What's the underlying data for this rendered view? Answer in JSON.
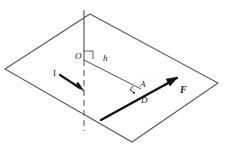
{
  "figure": {
    "type": "geometry-diagram",
    "title": "",
    "background_color": "#ffffff",
    "line_color": "#4d4d4d",
    "bold_line_color": "#111111",
    "label_color": "#1a1a1a",
    "labels": {
      "origin": "O",
      "distance": "h",
      "point_a": "A",
      "point_d": "D",
      "force": "F",
      "current": "I"
    },
    "elements": {
      "plane": "parallelogram-plane",
      "axis": "vertical-axis-line",
      "axis_dashed_segment": "dashed-below-plane",
      "moment_arm": "segment-O-to-A",
      "force_vector": "bold-arrow-F",
      "current_vector": "bold-arrow-I",
      "right_angle_at_O": "right-angle-marker",
      "right_angle_at_A": "right-angle-marker"
    }
  }
}
